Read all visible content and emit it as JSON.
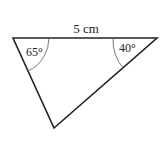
{
  "diagram": {
    "type": "triangle",
    "side_label": "5 cm",
    "angles": [
      {
        "vertex": "top-left",
        "label": "65°"
      },
      {
        "vertex": "top-right",
        "label": "40°"
      }
    ],
    "colors": {
      "stroke": "#222222",
      "arc": "#555555",
      "text": "#222222",
      "background": "#ffffff"
    }
  }
}
